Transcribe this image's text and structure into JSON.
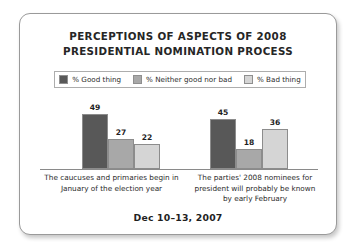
{
  "card": {
    "background": "#ffffff",
    "border_color": "#9a9a9a"
  },
  "title": {
    "line1": "PERCEPTIONS OF ASPECTS OF 2008",
    "line2": "PRESIDENTIAL NOMINATION PROCESS"
  },
  "legend": {
    "items": [
      {
        "label": "% Good thing",
        "color": "#585858"
      },
      {
        "label": "% Neither good nor bad",
        "color": "#a8a8a8"
      },
      {
        "label": "% Bad thing",
        "color": "#d5d5d5"
      }
    ]
  },
  "footer": {
    "date": "Dec 10–13, 2007"
  },
  "chart_data": {
    "type": "bar",
    "title": "PERCEPTIONS OF ASPECTS OF 2008 PRESIDENTIAL NOMINATION PROCESS",
    "subtitle": "Dec 10–13, 2007",
    "xlabel": "",
    "ylabel": "",
    "ylim": [
      0,
      60
    ],
    "grid": false,
    "legend_position": "top",
    "categories": [
      "The caucuses and primaries begin in January of the election year",
      "The parties' 2008 nominees for president will probably be known by early February"
    ],
    "category_lines": [
      [
        "The caucuses and primaries begin in",
        "January of the election year"
      ],
      [
        "The parties' 2008 nominees for",
        "president will probably be known",
        "by early February"
      ]
    ],
    "series": [
      {
        "name": "% Good thing",
        "color": "#585858",
        "values": [
          49,
          45
        ]
      },
      {
        "name": "% Neither good nor bad",
        "color": "#a8a8a8",
        "values": [
          27,
          18
        ]
      },
      {
        "name": "% Bad thing",
        "color": "#d5d5d5",
        "values": [
          22,
          36
        ]
      }
    ]
  }
}
